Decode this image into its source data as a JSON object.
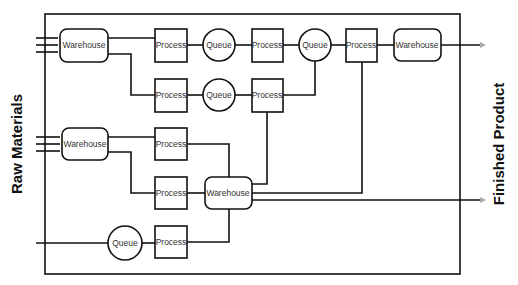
{
  "diagram": {
    "left_label": "Raw Materials",
    "right_label": "Finished Product",
    "nodes": {
      "warehouse_in_top": "Warehouse",
      "warehouse_in_mid": "Warehouse",
      "warehouse_center": "Warehouse",
      "warehouse_out": "Warehouse",
      "process_r1_1": "Process",
      "process_r1_2": "Process",
      "process_r1_3": "Process",
      "process_r2_1": "Process",
      "process_r2_2": "Process",
      "process_r3": "Process",
      "process_r4": "Process",
      "process_r5": "Process",
      "queue_r1_1": "Queue",
      "queue_r1_2": "Queue",
      "queue_r2": "Queue",
      "queue_r5": "Queue"
    }
  }
}
